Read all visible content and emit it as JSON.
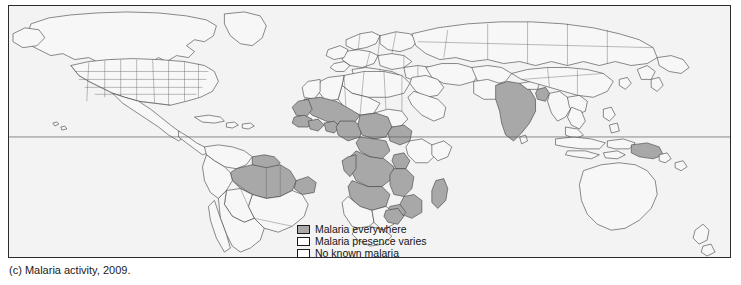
{
  "figure": {
    "caption": "(c) Malaria activity, 2009.",
    "frame": {
      "border_color": "#2b2b2b",
      "background_color": "#f3f3f3"
    }
  },
  "map": {
    "title": "World malaria activity map",
    "projection": "robinson",
    "equator_line": {
      "visible": true,
      "color": "#5a5a5a"
    },
    "colors": {
      "endemic_fill": "#a8a8a8",
      "non_endemic_fill": "#f7f7f7",
      "border_stroke": "#3c3c3c",
      "ocean": "#f3f3f3"
    },
    "regions_endemic": [
      "Amazon Basin (Brazil)",
      "Guyana",
      "Suriname",
      "French Guiana",
      "West Africa",
      "Central Africa",
      "Sahel",
      "Sudan",
      "Democratic Republic of Congo",
      "Angola",
      "Zambia",
      "Mozambique",
      "Tanzania",
      "Madagascar",
      "India",
      "Bangladesh",
      "Papua New Guinea"
    ],
    "regions_no_malaria": [
      "United States",
      "Canada",
      "Europe",
      "Russia",
      "Australia",
      "New Zealand",
      "North Africa",
      "Arabian Peninsula",
      "Japan",
      "Argentina",
      "Chile"
    ]
  },
  "legend": {
    "items": [
      {
        "label": "Malaria everywhere",
        "fill": "#a8a8a8",
        "swatch_name": "legend-swatch-endemic"
      },
      {
        "label": "Malaria presence varies",
        "fill": "#ffffff",
        "swatch_name": "legend-swatch-varies"
      },
      {
        "label": "No known malaria",
        "fill": "#ffffff",
        "swatch_name": "legend-swatch-none"
      }
    ]
  }
}
